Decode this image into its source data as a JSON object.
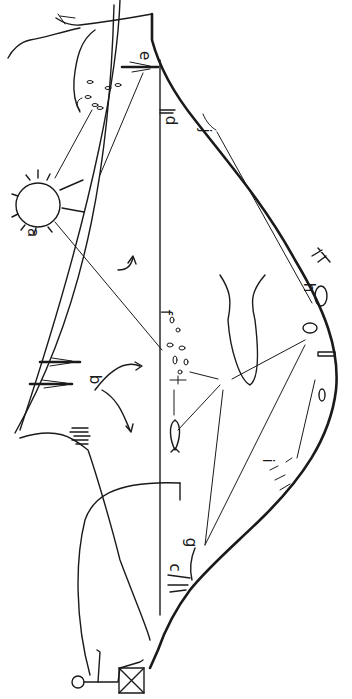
{
  "diagram": {
    "orientation": "rotated-90",
    "colors": {
      "ink": "#1a1a1a",
      "background": "#ffffff"
    },
    "labels": [
      {
        "id": "a",
        "text": "a",
        "depicts": "sun"
      },
      {
        "id": "b",
        "text": "b",
        "depicts": "emergent plants / shore runoff"
      },
      {
        "id": "c",
        "text": "c",
        "depicts": "submerged plants near shore"
      },
      {
        "id": "d",
        "text": "d",
        "depicts": "water surface near far shore"
      },
      {
        "id": "e",
        "text": "e",
        "depicts": "emergent reed at far shore"
      },
      {
        "id": "f",
        "text": "f",
        "depicts": "plankton"
      },
      {
        "id": "g",
        "text": "g",
        "depicts": "littoral plants"
      },
      {
        "id": "h",
        "text": "h",
        "depicts": "benthic invertebrates"
      },
      {
        "id": "i",
        "text": "i",
        "depicts": "bottom organic matter"
      },
      {
        "id": "j",
        "text": "j",
        "depicts": "shoreline organisms"
      }
    ],
    "figures": [
      "sun",
      "large fish",
      "small fish",
      "angler seated on crate",
      "tree with falling leaves",
      "reeds",
      "insect larvae"
    ]
  }
}
